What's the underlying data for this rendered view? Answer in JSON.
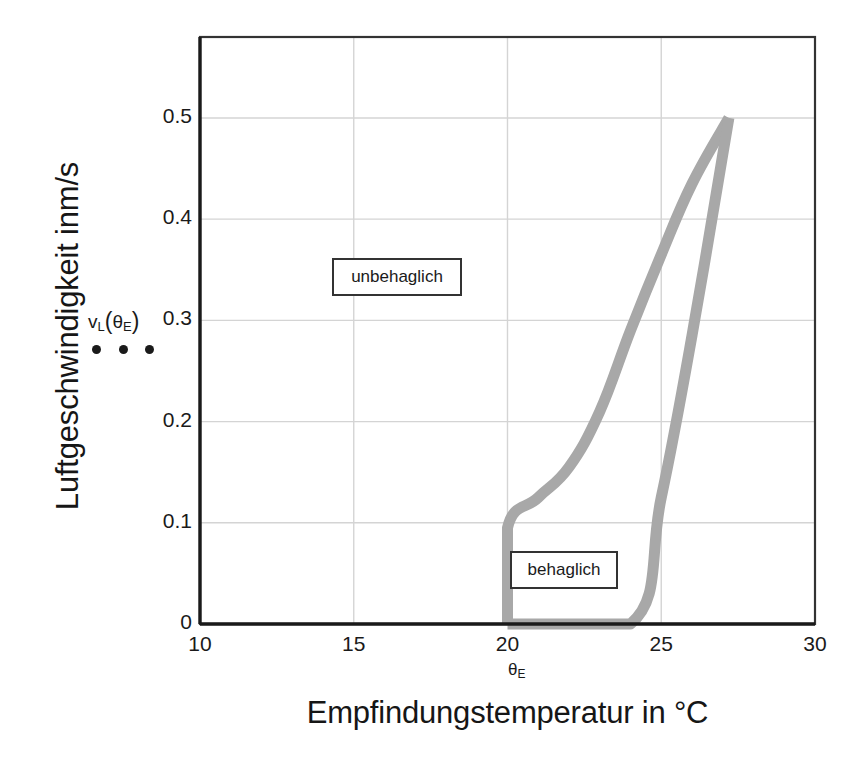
{
  "chart_data": {
    "type": "line",
    "title": "",
    "xlabel": "Empfindungstemperatur in °C",
    "ylabel": "Luftgeschwindigkeit inm/s",
    "xlim": [
      10,
      30
    ],
    "ylim": [
      0,
      0.58
    ],
    "xticks": [
      10,
      15,
      20,
      25,
      30
    ],
    "xticklabels": [
      "10",
      "15",
      "20",
      "25",
      "30"
    ],
    "yticks": [
      0,
      0.1,
      0.2,
      0.3,
      0.4,
      0.5
    ],
    "yticklabels": [
      "0",
      "0.1",
      "0.2",
      "0.3",
      "0.4",
      "0.5"
    ],
    "grid": true,
    "legend": "none",
    "line_color": "#a8a8a8",
    "line_width": 11,
    "series": [
      {
        "name": "upper-boundary",
        "comment": "left/upper comfort boundary: rises from axis at 20 °C up to apex",
        "points": [
          [
            20.0,
            0.0
          ],
          [
            20.0,
            0.095
          ],
          [
            21.0,
            0.125
          ],
          [
            22.0,
            0.155
          ],
          [
            23.0,
            0.21
          ],
          [
            24.0,
            0.29
          ],
          [
            25.0,
            0.365
          ],
          [
            26.0,
            0.435
          ],
          [
            27.2,
            0.5
          ]
        ]
      },
      {
        "name": "lower-boundary",
        "comment": "bottom/right comfort boundary: along axis to 24 °C then steeply up to apex",
        "points": [
          [
            20.0,
            0.0
          ],
          [
            24.0,
            0.0
          ],
          [
            25.0,
            0.125
          ],
          [
            26.0,
            0.285
          ],
          [
            27.2,
            0.5
          ]
        ]
      }
    ],
    "annotations": [
      {
        "name": "unbehaglich",
        "text": "unbehaglich",
        "x": 16.3,
        "y": 0.375,
        "boxed": true
      },
      {
        "name": "behaglich",
        "text": "behaglich",
        "x": 21.9,
        "y": 0.055,
        "boxed": true
      },
      {
        "name": "vl-theta-e",
        "text": "vL(θE)",
        "base": "v",
        "sub1": "L",
        "paren_open": "(",
        "theta": "θ",
        "sub2": "E",
        "paren_close": ")",
        "x": 10.0,
        "y": 0.3,
        "boxed": false
      }
    ],
    "theta_e_marker": {
      "label": "θE",
      "theta": "θ",
      "sub": "E",
      "x": 20.3
    },
    "dots": {
      "name": "ellipsis-dots",
      "count": 3,
      "y": 0.275
    }
  },
  "colors": {
    "curve": "#a8a8a8",
    "axis": "#1a1a1a",
    "grid": "#d4d4d4",
    "text": "#1a1a1a",
    "background": "#ffffff",
    "box_border": "#333333"
  }
}
